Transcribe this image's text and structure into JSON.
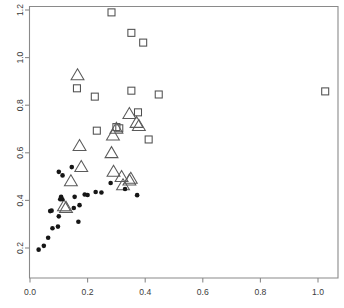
{
  "chart_data": {
    "type": "scatter",
    "title": "",
    "xlabel": "",
    "ylabel": "",
    "xlim": [
      -0.04,
      1.07
    ],
    "ylim": [
      0.155,
      1.24
    ],
    "grid": false,
    "legend": "none",
    "xticks": [
      0.0,
      0.2,
      0.4,
      0.6,
      0.8,
      1.0
    ],
    "xticklabels": [
      "0.0",
      "0.2",
      "0.4",
      "0.6",
      "0.8",
      "1.0"
    ],
    "yticks": [
      0.2,
      0.4,
      0.6,
      0.8,
      1.0,
      1.2
    ],
    "yticklabels": [
      "0.2",
      "0.4",
      "0.6",
      "0.8",
      "1.0",
      "1.2"
    ],
    "series": [
      {
        "name": "squares",
        "marker": "square",
        "color": "#4f4f4f",
        "size": 7,
        "points": [
          [
            0.283,
            1.19
          ],
          [
            0.352,
            1.104
          ],
          [
            0.393,
            1.063
          ],
          [
            0.163,
            0.871
          ],
          [
            0.225,
            0.836
          ],
          [
            0.352,
            0.861
          ],
          [
            0.447,
            0.845
          ],
          [
            1.025,
            0.858
          ],
          [
            0.232,
            0.693
          ],
          [
            0.3,
            0.708
          ],
          [
            0.31,
            0.703
          ],
          [
            0.375,
            0.77
          ],
          [
            0.412,
            0.656
          ]
        ]
      },
      {
        "name": "triangles",
        "marker": "triangle",
        "color": "#5a5a5a",
        "size": 14,
        "points": [
          [
            0.165,
            0.925
          ],
          [
            0.172,
            0.628
          ],
          [
            0.178,
            0.54
          ],
          [
            0.142,
            0.48
          ],
          [
            0.283,
            0.598
          ],
          [
            0.288,
            0.672
          ],
          [
            0.3,
            0.7
          ],
          [
            0.345,
            0.762
          ],
          [
            0.37,
            0.725
          ],
          [
            0.378,
            0.712
          ],
          [
            0.29,
            0.52
          ],
          [
            0.318,
            0.498
          ],
          [
            0.323,
            0.463
          ],
          [
            0.345,
            0.483
          ],
          [
            0.35,
            0.49
          ],
          [
            0.118,
            0.375
          ],
          [
            0.125,
            0.368
          ]
        ]
      },
      {
        "name": "dots",
        "marker": "circle",
        "color": "#161616",
        "size": 2.3,
        "points": [
          [
            0.03,
            0.193
          ],
          [
            0.048,
            0.209
          ],
          [
            0.063,
            0.243
          ],
          [
            0.078,
            0.283
          ],
          [
            0.097,
            0.29
          ],
          [
            0.07,
            0.355
          ],
          [
            0.075,
            0.357
          ],
          [
            0.1,
            0.333
          ],
          [
            0.105,
            0.405
          ],
          [
            0.108,
            0.415
          ],
          [
            0.112,
            0.405
          ],
          [
            0.113,
            0.505
          ],
          [
            0.1,
            0.52
          ],
          [
            0.145,
            0.54
          ],
          [
            0.152,
            0.368
          ],
          [
            0.155,
            0.415
          ],
          [
            0.168,
            0.31
          ],
          [
            0.172,
            0.38
          ],
          [
            0.19,
            0.425
          ],
          [
            0.2,
            0.423
          ],
          [
            0.228,
            0.435
          ],
          [
            0.248,
            0.433
          ],
          [
            0.28,
            0.473
          ],
          [
            0.33,
            0.448
          ],
          [
            0.372,
            0.422
          ]
        ]
      }
    ]
  }
}
